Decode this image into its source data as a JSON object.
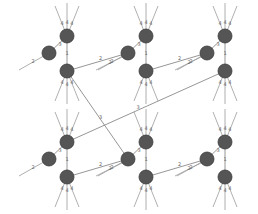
{
  "diagram": {
    "title": "",
    "node_color": "#555555",
    "edge_color": "#8a8a8a",
    "cells": [
      {
        "id": "c1",
        "row": 0,
        "col": 0
      },
      {
        "id": "c2",
        "row": 0,
        "col": 1
      },
      {
        "id": "c3",
        "row": 0,
        "col": 2
      },
      {
        "id": "c4",
        "row": 1,
        "col": 0
      },
      {
        "id": "c5",
        "row": 1,
        "col": 1
      },
      {
        "id": "c6",
        "row": 1,
        "col": 2
      }
    ],
    "edge_labels": {
      "horizontal": "2",
      "diagonal": "3",
      "vertical": "1",
      "fan": "4"
    },
    "cross_links": [
      {
        "from": "c1.bottom",
        "to": "c5.left",
        "label": "3"
      },
      {
        "from": "c3.bottom",
        "to": "c4.top",
        "label": "3"
      },
      {
        "from": "c1.bottom",
        "to": "c2.left",
        "label": "2"
      },
      {
        "from": "c2.bottom",
        "to": "c3.left",
        "label": "2"
      },
      {
        "from": "c4.bottom",
        "to": "c5.left",
        "label": "2"
      },
      {
        "from": "c5.bottom",
        "to": "c6.left",
        "label": "2"
      }
    ]
  }
}
